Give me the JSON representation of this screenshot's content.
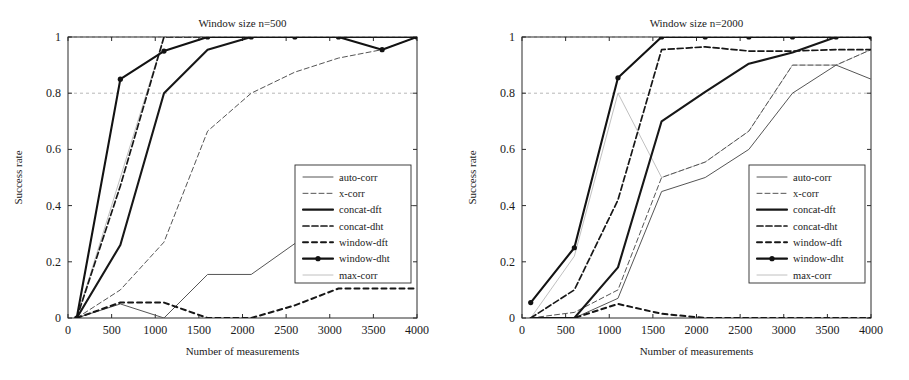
{
  "figure": {
    "width": 909,
    "height": 380,
    "background": "#ffffff"
  },
  "series_styles": {
    "auto-corr": {
      "color": "#555555",
      "width": 1.0,
      "dash": "none",
      "marker": "none"
    },
    "x-corr": {
      "color": "#555555",
      "width": 1.0,
      "dash": "5 3",
      "marker": "none"
    },
    "concat-dft": {
      "color": "#171717",
      "width": 2.1,
      "dash": "none",
      "marker": "none"
    },
    "concat-dht": {
      "color": "#171717",
      "width": 1.7,
      "dash": "6 3",
      "marker": "none"
    },
    "window-dft": {
      "color": "#171717",
      "width": 2.0,
      "dash": "5 4",
      "marker": "none"
    },
    "window-dht": {
      "color": "#121212",
      "width": 2.1,
      "dash": "none",
      "marker": "dot"
    },
    "max-corr": {
      "color": "#b9b9b9",
      "width": 0.9,
      "dash": "none",
      "marker": "none"
    }
  },
  "chart_data": [
    {
      "type": "line",
      "panel_id": "left",
      "title": "Window size n=500",
      "xlabel": "Number of measurements",
      "ylabel": "Success rate",
      "xlim": [
        0,
        4000
      ],
      "ylim": [
        0,
        1
      ],
      "xticks": [
        0,
        500,
        1000,
        1500,
        2000,
        2500,
        3000,
        3500,
        4000
      ],
      "xticklabels": [
        "0",
        "500",
        "1000",
        "1500",
        "2000",
        "2500",
        "3000",
        "3500",
        "4000"
      ],
      "yticks": [
        0,
        0.2,
        0.4,
        0.6,
        0.8,
        1
      ],
      "yticklabels": [
        "0",
        "0.2",
        "0.4",
        "0.6",
        "0.8",
        "1"
      ],
      "grid": "dashed-horizontal-at-0.8-and-1",
      "legend_position": "center-right",
      "legend_entries": [
        "auto-corr",
        "x-corr",
        "concat-dft",
        "concat-dht",
        "window-dft",
        "window-dht",
        "max-corr"
      ],
      "x": [
        100,
        600,
        1100,
        1600,
        2100,
        2600,
        3100,
        3600,
        4000
      ],
      "series": [
        {
          "name": "auto-corr",
          "values": [
            0.0,
            0.05,
            0.0,
            0.155,
            0.155,
            0.265,
            0.4,
            0.4,
            0.4
          ]
        },
        {
          "name": "x-corr",
          "values": [
            0.0,
            0.1,
            0.27,
            0.665,
            0.8,
            0.875,
            0.925,
            0.955,
            1.0
          ]
        },
        {
          "name": "concat-dft",
          "values": [
            0.0,
            0.26,
            0.8,
            0.955,
            1.0,
            1.0,
            1.0,
            1.0,
            1.0
          ]
        },
        {
          "name": "concat-dht",
          "values": [
            0.0,
            0.47,
            1.0,
            1.0,
            1.0,
            1.0,
            1.0,
            1.0,
            1.0
          ]
        },
        {
          "name": "window-dft",
          "values": [
            0.0,
            0.055,
            0.055,
            0.0,
            0.0,
            0.045,
            0.105,
            0.105,
            0.105
          ]
        },
        {
          "name": "window-dht",
          "values": [
            0.0,
            0.85,
            0.95,
            1.0,
            1.0,
            1.0,
            1.0,
            0.955,
            1.0
          ]
        },
        {
          "name": "max-corr",
          "values": [
            0.0,
            0.5,
            1.0,
            1.0,
            1.0,
            1.0,
            1.0,
            1.0,
            1.0
          ]
        }
      ]
    },
    {
      "type": "line",
      "panel_id": "right",
      "title": "Window size n=2000",
      "xlabel": "Number of measurements",
      "ylabel": "Success rate",
      "xlim": [
        0,
        4000
      ],
      "ylim": [
        0,
        1
      ],
      "xticks": [
        0,
        500,
        1000,
        1500,
        2000,
        2500,
        3000,
        3500,
        4000
      ],
      "xticklabels": [
        "0",
        "500",
        "1000",
        "1500",
        "2000",
        "2500",
        "3000",
        "3500",
        "4000"
      ],
      "yticks": [
        0,
        0.2,
        0.4,
        0.6,
        0.8,
        1
      ],
      "yticklabels": [
        "0",
        "0.2",
        "0.4",
        "0.6",
        "0.8",
        "1"
      ],
      "grid": "dashed-horizontal-at-0.8-and-1",
      "legend_position": "center-right",
      "legend_entries": [
        "auto-corr",
        "x-corr",
        "concat-dft",
        "concat-dht",
        "window-dft",
        "window-dht",
        "max-corr"
      ],
      "x": [
        100,
        600,
        1100,
        1600,
        2100,
        2600,
        3100,
        3600,
        4000
      ],
      "series": [
        {
          "name": "auto-corr",
          "values": [
            0.0,
            0.0,
            0.07,
            0.45,
            0.5,
            0.6,
            0.8,
            0.9,
            0.85
          ]
        },
        {
          "name": "x-corr",
          "values": [
            0.0,
            0.02,
            0.1,
            0.5,
            0.555,
            0.665,
            0.9,
            0.9,
            0.955
          ]
        },
        {
          "name": "concat-dft",
          "values": [
            0.0,
            0.0,
            0.18,
            0.7,
            0.805,
            0.905,
            0.945,
            1.0,
            1.0
          ]
        },
        {
          "name": "concat-dht",
          "values": [
            0.0,
            0.1,
            0.42,
            0.955,
            0.965,
            0.95,
            0.95,
            0.955,
            0.955
          ]
        },
        {
          "name": "window-dft",
          "values": [
            0.0,
            0.0,
            0.05,
            0.015,
            0.0,
            0.0,
            0.0,
            0.0,
            0.0
          ]
        },
        {
          "name": "window-dht",
          "values": [
            0.055,
            0.25,
            0.855,
            1.0,
            1.0,
            1.0,
            1.0,
            1.0,
            1.0
          ]
        },
        {
          "name": "max-corr",
          "values": [
            0.0,
            0.22,
            0.8,
            0.5,
            0.555,
            0.665,
            0.9,
            0.9,
            0.955
          ]
        }
      ]
    }
  ]
}
